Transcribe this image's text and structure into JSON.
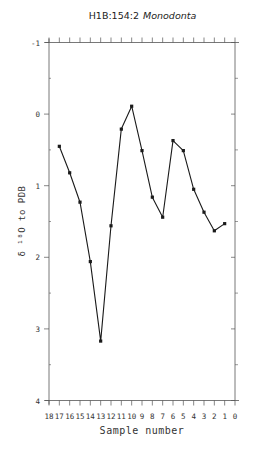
{
  "chart_data": {
    "type": "line",
    "title": "H1B:154:2",
    "title_species": "Monodonta",
    "xlabel": "Sample number",
    "ylabel": "δ ¹⁸O to PDB",
    "x_ticks": [
      18,
      17,
      16,
      15,
      14,
      13,
      12,
      11,
      10,
      9,
      8,
      7,
      6,
      5,
      4,
      3,
      2,
      1,
      0
    ],
    "x_tick_labels": [
      "18",
      "17",
      "16",
      "15",
      "14",
      "13",
      "12",
      "11",
      "10",
      "9",
      "8",
      "7",
      "6",
      "5",
      "4",
      "3",
      "2",
      "1",
      "0"
    ],
    "xlim": [
      18,
      0
    ],
    "y_ticks": [
      -1,
      0,
      1,
      2,
      3,
      4
    ],
    "y_tick_labels": [
      "-1",
      "0",
      "1",
      "2",
      "3",
      "4"
    ],
    "ylim": [
      -1,
      4
    ],
    "y_inverted": true,
    "grid": false,
    "legend": null,
    "series": [
      {
        "name": "Monodonta",
        "x": [
          17,
          16,
          15,
          14,
          13,
          12,
          11,
          10,
          9,
          8,
          7,
          6,
          5,
          4,
          3,
          2,
          1
        ],
        "values": [
          0.45,
          0.82,
          1.23,
          2.06,
          3.17,
          1.56,
          0.21,
          -0.11,
          0.51,
          1.16,
          1.44,
          0.37,
          0.51,
          1.05,
          1.37,
          1.63,
          1.53
        ]
      }
    ],
    "colors": {
      "line": "#1a1a1a",
      "axis": "#555555",
      "text": "#333333"
    }
  }
}
